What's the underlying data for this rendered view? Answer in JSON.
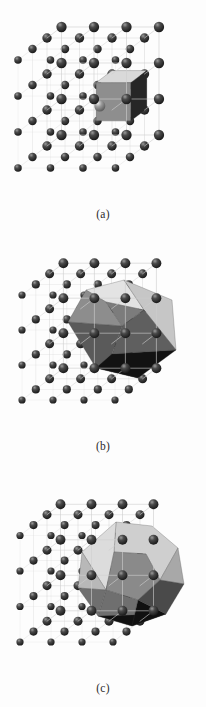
{
  "figure": {
    "background_color": "#fdfdfd",
    "width": 206,
    "height": 707
  },
  "panels": [
    {
      "id": "a",
      "caption": "(a)",
      "lattice_type": "simple-cubic",
      "lattice": {
        "nx": 4,
        "ny": 4,
        "nz": 4,
        "sphere_color": "#2a2a2a",
        "sphere_highlight_color": "#bdbdbd",
        "edge_color": "#cfcfcf",
        "sphere_radius": 4.6
      },
      "cell": {
        "name": "cube",
        "faces": [
          {
            "name": "front",
            "color": "#8e8e8e"
          },
          {
            "name": "right",
            "color": "#262626"
          },
          {
            "name": "top",
            "color": "#d9d9d9"
          }
        ],
        "interior_sphere_color": "#6d6d6d"
      }
    },
    {
      "id": "b",
      "caption": "(b)",
      "lattice_type": "body-centred-cubic",
      "lattice": {
        "nx": 4,
        "ny": 4,
        "nz": 4,
        "sphere_color": "#2a2a2a",
        "sphere_highlight_color": "#bdbdbd",
        "edge_color": "#cfcfcf",
        "sphere_radius": 4.4
      },
      "cell": {
        "name": "rhombic-dodecahedron",
        "faces": [
          {
            "name": "top-left",
            "color": "#e3e3e3"
          },
          {
            "name": "top-right",
            "color": "#c6c6c6"
          },
          {
            "name": "left-upper",
            "color": "#8d8d8d"
          },
          {
            "name": "left-lower",
            "color": "#5a5a5a"
          },
          {
            "name": "front",
            "color": "#7c7c7c"
          },
          {
            "name": "right",
            "color": "#5f5f5f"
          },
          {
            "name": "bottom",
            "color": "#121212"
          }
        ]
      }
    },
    {
      "id": "c",
      "caption": "(c)",
      "lattice_type": "face-centred-cubic",
      "lattice": {
        "nx": 4,
        "ny": 4,
        "nz": 4,
        "sphere_color": "#2a2a2a",
        "sphere_highlight_color": "#bdbdbd",
        "edge_color": "#cfcfcf",
        "sphere_radius": 4.4
      },
      "cell": {
        "name": "truncated-octahedron",
        "faces": [
          {
            "name": "top",
            "color": "#cfcfcf"
          },
          {
            "name": "upper-left",
            "color": "#dcdcdc"
          },
          {
            "name": "upper-right",
            "color": "#a8a8a8"
          },
          {
            "name": "left",
            "color": "#b8b8b8"
          },
          {
            "name": "front",
            "color": "#8a8a8a"
          },
          {
            "name": "right",
            "color": "#4a4a4a"
          },
          {
            "name": "lower-front",
            "color": "#6f6f6f"
          },
          {
            "name": "bottom",
            "color": "#101010"
          }
        ]
      }
    }
  ]
}
